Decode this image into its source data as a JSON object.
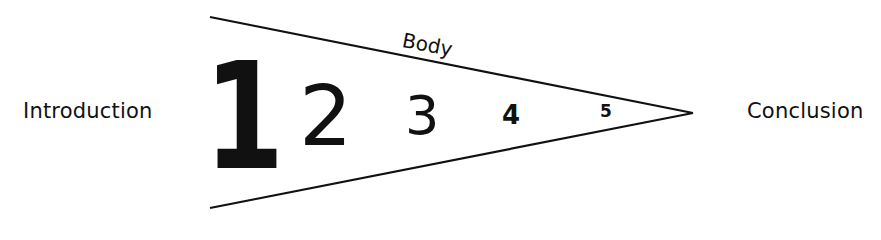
{
  "diagram": {
    "left_label": "Introduction",
    "right_label": "Conclusion",
    "wedge_label": "Body",
    "sections": [
      {
        "label": "1"
      },
      {
        "label": "2"
      },
      {
        "label": "3"
      },
      {
        "label": "4"
      },
      {
        "label": "5"
      }
    ],
    "colors": {
      "line": "#111111",
      "text": "#111111",
      "background": "#ffffff"
    }
  }
}
